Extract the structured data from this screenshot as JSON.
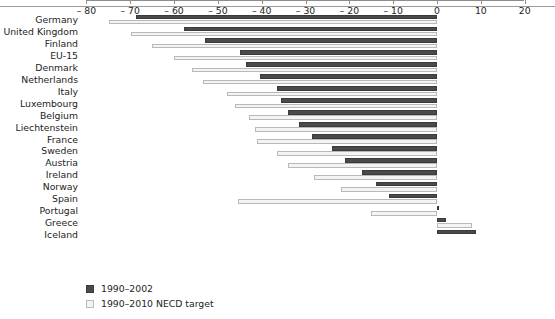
{
  "chart_data": {
    "type": "bar",
    "orientation": "horizontal",
    "title": "",
    "subtitle": "",
    "xlabel": "%",
    "ylabel": "",
    "xlim": [
      -80,
      20
    ],
    "xticks": [
      -80,
      -70,
      -60,
      -50,
      -40,
      -30,
      -20,
      -10,
      0,
      10,
      20
    ],
    "xticklabels": [
      "– 80",
      "– 70",
      "– 60",
      "– 50",
      "– 40",
      "– 30",
      "– 20",
      "– 10",
      "0",
      "10",
      "20"
    ],
    "grid": false,
    "legend_position": "bottom-left",
    "categories": [
      "Germany",
      "United Kingdom",
      "Finland",
      "EU-15",
      "Denmark",
      "Netherlands",
      "Italy",
      "Luxembourg",
      "Belgium",
      "Liechtenstein",
      "France",
      "Sweden",
      "Austria",
      "Ireland",
      "Norway",
      "Spain",
      "Portugal",
      "Greece",
      "Iceland"
    ],
    "series": [
      {
        "name": "1990–2002",
        "color": "#4a4a4a",
        "values": [
          -68.7,
          -57.7,
          -53.0,
          -45.0,
          -43.5,
          -40.5,
          -36.5,
          -35.5,
          -34.0,
          -31.5,
          -28.5,
          -24.0,
          -21.0,
          -17.0,
          -14.0,
          -11.0,
          0.0,
          2.0,
          9.0
        ]
      },
      {
        "name": "1990–2010 NECD target",
        "color": "#f4f4f4",
        "values": [
          -74.9,
          -69.9,
          -65.0,
          -60.0,
          -56.0,
          -53.5,
          -48.0,
          -46.0,
          -43.0,
          -41.5,
          -41.0,
          -36.5,
          -34.0,
          -28.0,
          -22.0,
          -45.5,
          -15.0,
          8.0,
          null
        ]
      }
    ]
  },
  "legend": {
    "items": [
      {
        "label": "1990–2002",
        "swatch": "dark"
      },
      {
        "label": "1990–2010 NECD target",
        "swatch": "light"
      }
    ]
  },
  "axis": {
    "unit_label": "%"
  }
}
